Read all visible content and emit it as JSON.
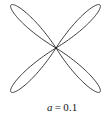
{
  "figure": {
    "kind": "mathematical-plot",
    "background_color": "#ffffff",
    "curve_color": "#232323",
    "curve_stroke_width": 0.9,
    "caption": {
      "variable": "a",
      "operator": "=",
      "value": "0.1",
      "full_text": "a = 0.1",
      "color": "#141414"
    }
  },
  "chart_data": {
    "type": "line",
    "title": "",
    "subtitle": "",
    "xlabel": "",
    "ylabel": "",
    "annotations": [
      "a = 0.1"
    ],
    "legend": [],
    "legend_position": "none",
    "grid": false,
    "axes_visible": false,
    "tick_labels_x": [],
    "tick_labels_y": [],
    "xlim": [
      -1,
      1
    ],
    "ylim": [
      -1,
      1
    ],
    "polar": {
      "equation": "r = cos(2*theta - pi/2)",
      "petal_count": 4,
      "petal_angles_deg": [
        45,
        135,
        225,
        315
      ],
      "petal_half_width_deg": 13,
      "parameter_name": "a",
      "parameter_value": 0.1
    },
    "center_px": [
      56,
      48
    ],
    "petals": [
      {
        "name": "upper-left-petal",
        "tip_px": [
          11,
          5
        ],
        "angle_deg": 135
      },
      {
        "name": "upper-right-petal",
        "tip_px": [
          100,
          5
        ],
        "angle_deg": 45
      },
      {
        "name": "lower-left-petal",
        "tip_px": [
          11,
          92
        ],
        "angle_deg": 225
      },
      {
        "name": "lower-right-petal",
        "tip_px": [
          100,
          92
        ],
        "angle_deg": 315
      }
    ]
  }
}
